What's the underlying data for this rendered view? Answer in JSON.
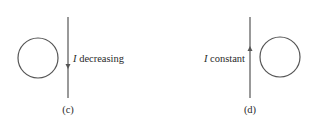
{
  "panels": [
    {
      "id": "c",
      "caption": "(c)",
      "current_symbol": "I",
      "current_state": " decreasing",
      "arrow_direction": "down",
      "loop_side": "left"
    },
    {
      "id": "d",
      "caption": "(d)",
      "current_symbol": "I",
      "current_state": " constant",
      "arrow_direction": "up",
      "loop_side": "right"
    }
  ],
  "colors": {
    "line": "#555555",
    "text": "#2a2a2a"
  }
}
